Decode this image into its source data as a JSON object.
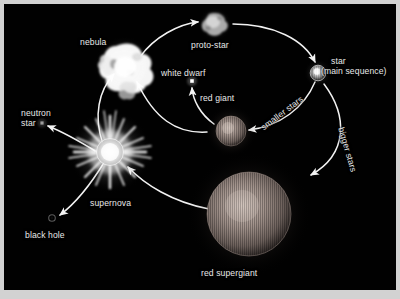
{
  "diagram": {
    "background_color": "#010101",
    "frame_color": "#d2d2d2",
    "text_color": "#e8e8e8",
    "arrow_color": "#f2f2f2"
  },
  "labels": {
    "nebula": "nebula",
    "proto_star": "proto-star",
    "star_line1": "star",
    "star_line2": "(main sequence)",
    "white_dwarf": "white dwarf",
    "red_giant": "red giant",
    "neutron_star_line1": "neutron",
    "neutron_star_line2": "star",
    "supernova": "supernova",
    "black_hole": "black hole",
    "red_supergiant": "red supergiant",
    "smaller_stars": "smaller stars",
    "bigger_stars": "bigger stars"
  },
  "objects": [
    {
      "name": "nebula",
      "label": "nebula",
      "kind": "irregular-cloud",
      "color": "#ffffff"
    },
    {
      "name": "proto-star",
      "label": "proto-star",
      "kind": "irregular-cloud",
      "color": "#b9b9b9"
    },
    {
      "name": "main-sequence-star",
      "label": "star (main sequence)",
      "kind": "small-glowing-disc",
      "color": "#cfcfcf"
    },
    {
      "name": "red-giant",
      "label": "red giant",
      "kind": "striated-sphere",
      "color": "#b0a09a"
    },
    {
      "name": "red-supergiant",
      "label": "red supergiant",
      "kind": "striated-sphere",
      "color": "#b5a49c"
    },
    {
      "name": "white-dwarf",
      "label": "white dwarf",
      "kind": "tiny-dot",
      "color": "#ffffff"
    },
    {
      "name": "supernova",
      "label": "supernova",
      "kind": "burst",
      "color": "#ffffff"
    },
    {
      "name": "neutron-star",
      "label": "neutron star",
      "kind": "tiny-dot",
      "color": "#9a9a9a"
    },
    {
      "name": "black-hole",
      "label": "black hole",
      "kind": "tiny-ring",
      "color": "#3a3a3a"
    }
  ],
  "transitions": [
    {
      "from": "nebula",
      "to": "proto-star",
      "label": ""
    },
    {
      "from": "proto-star",
      "to": "main-sequence-star",
      "label": ""
    },
    {
      "from": "main-sequence-star",
      "to": "red-giant",
      "label": "smaller stars"
    },
    {
      "from": "main-sequence-star",
      "to": "red-supergiant",
      "label": "bigger stars"
    },
    {
      "from": "red-giant",
      "to": "white-dwarf",
      "label": ""
    },
    {
      "from": "red-giant",
      "to": "nebula",
      "label": ""
    },
    {
      "from": "red-supergiant",
      "to": "supernova",
      "label": ""
    },
    {
      "from": "supernova",
      "to": "neutron-star",
      "label": ""
    },
    {
      "from": "supernova",
      "to": "black-hole",
      "label": ""
    },
    {
      "from": "supernova",
      "to": "nebula",
      "label": ""
    }
  ]
}
